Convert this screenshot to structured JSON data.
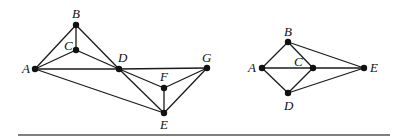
{
  "graphs": [
    {
      "id": "left-graph",
      "nodes": [
        {
          "id": "A",
          "x": 35,
          "y": 69,
          "lx": 22,
          "ly": 73
        },
        {
          "id": "B",
          "x": 76,
          "y": 25,
          "lx": 72,
          "ly": 18
        },
        {
          "id": "C",
          "x": 76,
          "y": 50,
          "lx": 64,
          "ly": 50
        },
        {
          "id": "D",
          "x": 119,
          "y": 69,
          "lx": 118,
          "ly": 62
        },
        {
          "id": "F",
          "x": 164,
          "y": 88,
          "lx": 160,
          "ly": 81
        },
        {
          "id": "G",
          "x": 207,
          "y": 68,
          "lx": 202,
          "ly": 62
        },
        {
          "id": "E",
          "x": 164,
          "y": 113,
          "lx": 160,
          "ly": 129
        }
      ],
      "edges": [
        [
          "A",
          "B"
        ],
        [
          "A",
          "C"
        ],
        [
          "B",
          "C"
        ],
        [
          "B",
          "D"
        ],
        [
          "C",
          "D"
        ],
        [
          "A",
          "D"
        ],
        [
          "D",
          "G"
        ],
        [
          "D",
          "F"
        ],
        [
          "D",
          "E"
        ],
        [
          "A",
          "E"
        ],
        [
          "F",
          "G"
        ],
        [
          "F",
          "E"
        ],
        [
          "G",
          "E"
        ]
      ]
    },
    {
      "id": "right-graph",
      "nodes": [
        {
          "id": "A",
          "x": 262,
          "y": 68,
          "lx": 248,
          "ly": 72
        },
        {
          "id": "B",
          "x": 288,
          "y": 42,
          "lx": 284,
          "ly": 36
        },
        {
          "id": "C",
          "x": 313,
          "y": 68,
          "lx": 294,
          "ly": 66
        },
        {
          "id": "D",
          "x": 288,
          "y": 93,
          "lx": 284,
          "ly": 110
        },
        {
          "id": "E",
          "x": 364,
          "y": 68,
          "lx": 370,
          "ly": 72
        }
      ],
      "edges": [
        [
          "A",
          "B"
        ],
        [
          "A",
          "C"
        ],
        [
          "A",
          "D"
        ],
        [
          "B",
          "C"
        ],
        [
          "C",
          "D"
        ],
        [
          "B",
          "E"
        ],
        [
          "C",
          "E"
        ],
        [
          "D",
          "E"
        ]
      ]
    }
  ],
  "rule": {
    "x1": 18,
    "x2": 390,
    "y": 135
  }
}
